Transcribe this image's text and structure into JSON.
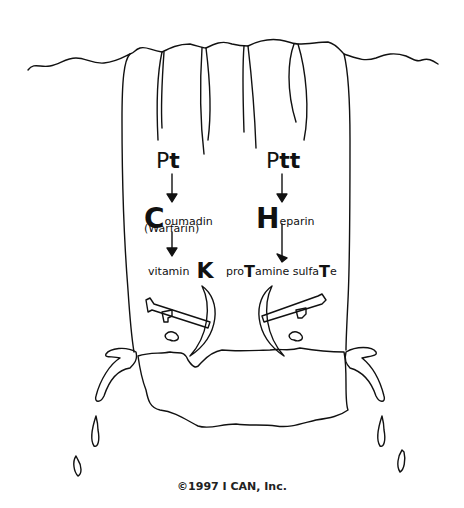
{
  "diagram": {
    "left_column": {
      "lab_test": {
        "prefix": "P",
        "suffix": "t"
      },
      "drug": {
        "initial": "C",
        "rest": "oumadin",
        "alt_name": "(Warfarin)"
      },
      "antidote": {
        "text": "vitamin",
        "initial": "K"
      }
    },
    "right_column": {
      "lab_test": {
        "prefix": "P",
        "suffix": "tt"
      },
      "drug": {
        "initial": "H",
        "rest": "eparin"
      },
      "antidote": {
        "part1": "pro",
        "cap1": "T",
        "part2": "amine sulfa",
        "cap2": "T",
        "part3": "e"
      }
    },
    "copyright": "©1997 I CAN, Inc."
  },
  "colors": {
    "ink": "#111111",
    "background": "#ffffff"
  }
}
